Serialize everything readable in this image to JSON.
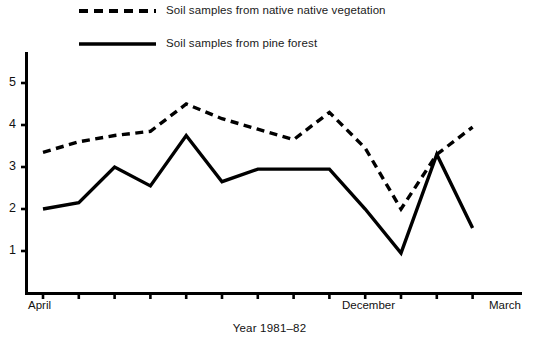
{
  "chart_data": {
    "type": "line",
    "title": "",
    "subtitle": "",
    "xlabel": "Year 1981–82",
    "ylabel": "",
    "grid": false,
    "legend_position": "top-left",
    "ylim": [
      0,
      5.6
    ],
    "ytick_labels": [
      "1",
      "2",
      "3",
      "4",
      "5"
    ],
    "ytick_values": [
      1,
      2,
      3,
      4,
      5
    ],
    "x_tick_count": 13,
    "xtick_labels_visible": [
      "April",
      "December",
      "March"
    ],
    "categories": [
      "April",
      "May",
      "June",
      "July",
      "August",
      "September",
      "October",
      "November",
      "December",
      "January",
      "February",
      "March-1",
      "March"
    ],
    "series": [
      {
        "name": "Soil samples from native native vegetation",
        "style": "dashed",
        "color": "#000000",
        "values": [
          3.35,
          3.6,
          3.75,
          3.85,
          4.5,
          4.15,
          3.9,
          3.65,
          4.3,
          3.45,
          2.0,
          3.3,
          3.95
        ]
      },
      {
        "name": "Soil samples from pine forest",
        "style": "solid",
        "color": "#000000",
        "values": [
          2.0,
          2.15,
          3.0,
          2.55,
          3.75,
          2.65,
          2.95,
          2.95,
          2.95,
          2.0,
          0.95,
          3.3,
          1.55
        ]
      }
    ]
  },
  "legend": {
    "items": [
      {
        "label": "Soil samples from native native vegetation",
        "swatch": "dashed-line-swatch"
      },
      {
        "label": "Soil samples from pine forest",
        "swatch": "solid-line-swatch"
      }
    ]
  },
  "axes": {
    "x_labels": [
      {
        "text": "April",
        "left": 28
      },
      {
        "text": "December",
        "left": 342
      },
      {
        "text": "March",
        "left": 489
      }
    ],
    "y_labels": [
      {
        "text": "5",
        "top": 75
      },
      {
        "text": "4",
        "top": 117
      },
      {
        "text": "3",
        "top": 159
      },
      {
        "text": "2",
        "top": 201
      },
      {
        "text": "1",
        "top": 243
      }
    ],
    "x_axis_caption": "Year 1981–82"
  }
}
